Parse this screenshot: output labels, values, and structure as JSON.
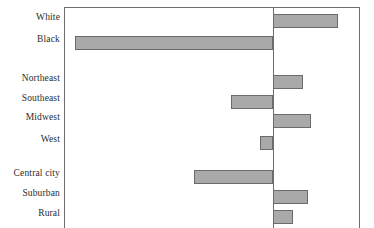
{
  "chart_data": {
    "type": "bar",
    "orientation": "horizontal",
    "title": "",
    "subtitle": "",
    "xlabel": "",
    "ylabel": "",
    "grid": false,
    "legend": null,
    "zero_line": true,
    "axis_ticks": [],
    "tick_labels": [],
    "xlim": [
      -31,
      14
    ],
    "categories": [
      "White",
      "Black",
      "Northeast",
      "Southeast",
      "Midwest",
      "West",
      "Central city",
      "Suburban",
      "Rural"
    ],
    "values": [
      10,
      -30,
      4.5,
      -6.5,
      6,
      -2,
      -12,
      5.5,
      3
    ],
    "groups": [
      {
        "name": "race",
        "categories": [
          "White",
          "Black"
        ]
      },
      {
        "name": "region",
        "categories": [
          "Northeast",
          "Southeast",
          "Midwest",
          "West"
        ]
      },
      {
        "name": "locality",
        "categories": [
          "Central city",
          "Suburban",
          "Rural"
        ]
      }
    ],
    "colors": {
      "bar_fill": "#a9a9a9",
      "bar_stroke": "#6b6b6b",
      "frame": "#6e6e6e",
      "zero_axis": "#6e6e6e",
      "label_text": "#2b2b2b",
      "background": "#ffffff"
    }
  },
  "geometry": {
    "frame": {
      "left": 64,
      "top": 7,
      "width": 296,
      "height": 230
    },
    "zero_x": 272,
    "px_per_unit": 6.6,
    "bars": [
      {
        "category": "White",
        "top": 13,
        "height": 14,
        "x0": 272,
        "x1": 337
      },
      {
        "category": "Black",
        "top": 35,
        "height": 14,
        "x0": 74,
        "x1": 272
      },
      {
        "category": "Northeast",
        "top": 74,
        "height": 14,
        "x0": 272,
        "x1": 302
      },
      {
        "category": "Southeast",
        "top": 94,
        "height": 14,
        "x0": 230,
        "x1": 272
      },
      {
        "category": "Midwest",
        "top": 113,
        "height": 14,
        "x0": 272,
        "x1": 310
      },
      {
        "category": "West",
        "top": 135,
        "height": 14,
        "x0": 259,
        "x1": 272
      },
      {
        "category": "Central city",
        "top": 169,
        "height": 14,
        "x0": 193,
        "x1": 272
      },
      {
        "category": "Suburban",
        "top": 189,
        "height": 14,
        "x0": 272,
        "x1": 307
      },
      {
        "category": "Rural",
        "top": 209,
        "height": 14,
        "x0": 272,
        "x1": 292
      }
    ],
    "labels": [
      {
        "text": "White",
        "top": 12
      },
      {
        "text": "Black",
        "top": 34
      },
      {
        "text": "Northeast",
        "top": 73
      },
      {
        "text": "Southeast",
        "top": 93
      },
      {
        "text": "Midwest",
        "top": 112
      },
      {
        "text": "West",
        "top": 134
      },
      {
        "text": "Central city",
        "top": 168
      },
      {
        "text": "Suburban",
        "top": 188
      },
      {
        "text": "Rural",
        "top": 208
      }
    ]
  }
}
